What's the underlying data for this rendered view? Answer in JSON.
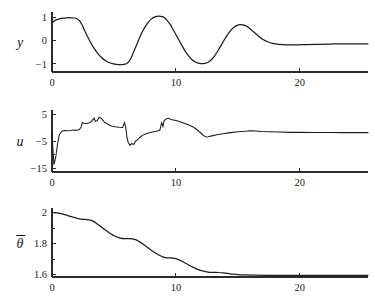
{
  "figure": {
    "title": "",
    "background_color": "#ffffff",
    "curve_color": "#1c1c1c",
    "axis_color": "#2b2b2b",
    "panel_count": 3
  },
  "chart_data": [
    {
      "type": "line",
      "panel_id": "panel-y",
      "title": "",
      "xlabel": "",
      "ylabel": "y",
      "ylabel_glyph": "y",
      "ylabel_has_overbar": false,
      "xlim": [
        0,
        25.5
      ],
      "ylim": [
        -1.35,
        1.25
      ],
      "xticks": [
        0,
        10,
        20
      ],
      "xtick_labels": [
        "0",
        "10",
        "20"
      ],
      "yticks": [
        -1,
        0,
        1
      ],
      "ytick_labels": [
        "-1",
        "0",
        "1"
      ],
      "grid": false,
      "legend": false,
      "series": [
        {
          "name": "y",
          "x": [
            0.0,
            0.15,
            0.35,
            0.6,
            0.9,
            1.2,
            1.5,
            1.8,
            2.0,
            2.2,
            2.4,
            2.6,
            2.85,
            3.1,
            3.4,
            3.7,
            4.0,
            4.3,
            4.6,
            4.9,
            5.2,
            5.5,
            5.8,
            6.0,
            6.2,
            6.4,
            6.6,
            6.85,
            7.1,
            7.4,
            7.7,
            8.0,
            8.3,
            8.6,
            8.9,
            9.1,
            9.3,
            9.55,
            9.8,
            10.1,
            10.4,
            10.7,
            11.0,
            11.3,
            11.6,
            11.9,
            12.2,
            12.5,
            12.8,
            13.1,
            13.4,
            13.7,
            14.0,
            14.3,
            14.6,
            14.9,
            15.2,
            15.5,
            15.8,
            16.1,
            16.4,
            16.7,
            17.0,
            17.4,
            17.8,
            18.3,
            19.0,
            19.8,
            20.6,
            21.5,
            22.4,
            23.3,
            24.2,
            25.0,
            25.5
          ],
          "y": [
            0.78,
            0.85,
            0.91,
            0.95,
            0.98,
            1.0,
            1.0,
            0.99,
            0.96,
            0.88,
            0.72,
            0.48,
            0.2,
            -0.06,
            -0.33,
            -0.55,
            -0.72,
            -0.85,
            -0.94,
            -0.99,
            -1.02,
            -1.03,
            -1.02,
            -0.99,
            -0.9,
            -0.72,
            -0.46,
            -0.15,
            0.18,
            0.5,
            0.76,
            0.94,
            1.04,
            1.07,
            1.05,
            0.99,
            0.88,
            0.7,
            0.46,
            0.18,
            -0.12,
            -0.4,
            -0.64,
            -0.82,
            -0.93,
            -0.98,
            -0.99,
            -0.95,
            -0.85,
            -0.67,
            -0.42,
            -0.14,
            0.13,
            0.37,
            0.55,
            0.66,
            0.7,
            0.68,
            0.6,
            0.47,
            0.33,
            0.19,
            0.07,
            -0.04,
            -0.11,
            -0.15,
            -0.17,
            -0.17,
            -0.16,
            -0.15,
            -0.14,
            -0.13,
            -0.13,
            -0.13,
            -0.13
          ]
        }
      ]
    },
    {
      "type": "line",
      "panel_id": "panel-u",
      "title": "",
      "xlabel": "",
      "ylabel": "u",
      "ylabel_glyph": "u",
      "ylabel_has_overbar": false,
      "xlim": [
        0,
        25.5
      ],
      "ylim": [
        -16.5,
        6.5
      ],
      "xticks": [
        0,
        10,
        20
      ],
      "xtick_labels": [
        "0",
        "10",
        "20"
      ],
      "yticks": [
        -15,
        -10,
        -5,
        5
      ],
      "ytick_labels": [
        "-15",
        "",
        "-5",
        "5"
      ],
      "ytick_labeled": [
        -15,
        -5,
        5
      ],
      "grid": false,
      "legend": false,
      "series": [
        {
          "name": "u",
          "x": [
            0.0,
            0.08,
            0.16,
            0.3,
            0.45,
            0.6,
            0.8,
            1.0,
            1.25,
            1.5,
            1.75,
            2.0,
            2.2,
            2.35,
            2.45,
            2.6,
            2.8,
            3.0,
            3.2,
            3.4,
            3.5,
            3.65,
            3.8,
            4.0,
            4.2,
            4.5,
            4.8,
            5.1,
            5.4,
            5.7,
            5.85,
            5.95,
            6.05,
            6.15,
            6.3,
            6.45,
            6.6,
            6.75,
            6.9,
            7.1,
            7.3,
            7.5,
            7.8,
            8.1,
            8.4,
            8.7,
            8.85,
            8.95,
            9.05,
            9.2,
            9.4,
            9.6,
            9.8,
            10.0,
            10.3,
            10.6,
            11.0,
            11.4,
            11.8,
            12.1,
            12.3,
            12.45,
            12.6,
            12.9,
            13.3,
            13.8,
            14.4,
            15.0,
            15.6,
            16.0,
            16.4,
            16.9,
            17.5,
            18.3,
            19.2,
            20.2,
            21.3,
            22.4,
            23.5,
            24.5,
            25.5
          ],
          "y": [
            -1.2,
            -8.5,
            -13.8,
            -11.0,
            -6.0,
            -2.6,
            -1.4,
            -1.1,
            -1.2,
            -1.1,
            -0.9,
            -1.0,
            -0.8,
            0.2,
            1.9,
            1.6,
            1.5,
            1.7,
            2.4,
            3.5,
            2.3,
            2.5,
            3.8,
            3.3,
            2.2,
            1.2,
            0.6,
            0.3,
            0.1,
            0.0,
            1.8,
            0.2,
            -3.6,
            -5.6,
            -6.6,
            -5.9,
            -6.3,
            -5.0,
            -4.6,
            -3.6,
            -2.9,
            -2.5,
            -2.0,
            -1.7,
            -1.4,
            -1.0,
            1.8,
            0.4,
            2.5,
            3.2,
            3.4,
            3.0,
            2.8,
            2.6,
            2.2,
            1.7,
            1.0,
            0.2,
            -1.2,
            -2.4,
            -3.2,
            -3.5,
            -3.4,
            -3.1,
            -2.7,
            -2.3,
            -1.9,
            -1.6,
            -1.4,
            -1.2,
            -1.3,
            -1.5,
            -1.6,
            -1.7,
            -1.8,
            -1.8,
            -1.85,
            -1.85,
            -1.9,
            -1.9,
            -1.9
          ]
        }
      ]
    },
    {
      "type": "line",
      "panel_id": "panel-theta",
      "title": "",
      "xlabel": "",
      "ylabel": "theta-bar",
      "ylabel_glyph": "θ",
      "ylabel_has_overbar": true,
      "xlim": [
        0,
        25.5
      ],
      "ylim": [
        1.585,
        2.03
      ],
      "xticks": [
        0,
        10,
        20
      ],
      "xtick_labels": [
        "0",
        "10",
        "20"
      ],
      "yticks": [
        1.6,
        1.7,
        1.8,
        1.9,
        2.0
      ],
      "ytick_labels": [
        "1.6",
        "",
        "1.8",
        "",
        "2"
      ],
      "ytick_labeled": [
        1.6,
        1.8,
        2.0
      ],
      "grid": false,
      "legend": false,
      "series": [
        {
          "name": "theta-bar",
          "x": [
            0.0,
            0.4,
            0.9,
            1.4,
            1.9,
            2.3,
            2.7,
            3.0,
            3.3,
            3.6,
            3.9,
            4.3,
            4.7,
            5.1,
            5.5,
            5.9,
            6.2,
            6.5,
            6.8,
            7.1,
            7.5,
            7.9,
            8.3,
            8.7,
            9.0,
            9.3,
            9.6,
            9.9,
            10.2,
            10.6,
            11.0,
            11.4,
            11.8,
            12.2,
            12.6,
            13.0,
            13.4,
            13.8,
            14.2,
            14.6,
            15.0,
            15.6,
            16.4,
            17.5,
            19.0,
            20.5,
            22.0,
            23.5,
            25.0,
            25.5
          ],
          "y": [
            2.0,
            1.998,
            1.99,
            1.978,
            1.966,
            1.959,
            1.956,
            1.953,
            1.945,
            1.93,
            1.912,
            1.888,
            1.866,
            1.848,
            1.836,
            1.832,
            1.833,
            1.831,
            1.824,
            1.81,
            1.788,
            1.764,
            1.742,
            1.724,
            1.713,
            1.708,
            1.708,
            1.705,
            1.697,
            1.682,
            1.664,
            1.647,
            1.633,
            1.623,
            1.617,
            1.615,
            1.614,
            1.612,
            1.608,
            1.603,
            1.6,
            1.598,
            1.597,
            1.596,
            1.596,
            1.596,
            1.596,
            1.596,
            1.596,
            1.596
          ]
        }
      ]
    }
  ],
  "axes_geometry": {
    "plot_left_px": 52,
    "plot_right_px": 368,
    "panel_y": {
      "top_px": 12,
      "baseline_px": 72
    },
    "panel_u": {
      "top_px": 110,
      "baseline_px": 172
    },
    "panel_theta": {
      "top_px": 208,
      "baseline_px": 277
    }
  }
}
